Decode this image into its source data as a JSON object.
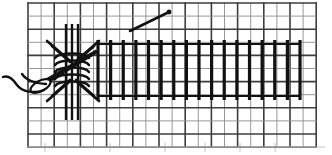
{
  "figure": {
    "background_color": "#ffffff",
    "ink_color": "#1a1a1a",
    "grid_line_color": "#4d4d4d",
    "grid_line_color_light": "#8c8c8c"
  },
  "canvas": {
    "width": 332,
    "height": 155
  },
  "fabric_grid": {
    "label": "even-weave fabric grid",
    "x": 28,
    "y": 3,
    "cell": 13.1,
    "columns": 22,
    "rows": 11,
    "line_width": 1.6,
    "minor_line_width": 0.9,
    "color": "#3d3d3d"
  },
  "stitch_band": {
    "label": "band of vertical satin stitches",
    "x_start": 98,
    "x_end": 300,
    "y_top": 44,
    "y_bottom": 96,
    "stitch_count": 16,
    "stitch_width": 3.2,
    "color": "#111111"
  },
  "wrapped_bar": {
    "label": "wrapped bar with coiled thread",
    "center_x": 72,
    "center_y": 70,
    "coil_count": 5,
    "coil_width": 34,
    "coil_height": 7,
    "bar_top": 24,
    "bar_bottom": 120,
    "color": "#111111"
  },
  "pulled_threads": {
    "label": "fabric threads drawn into an hourglass",
    "top_left": [
      48,
      42
    ],
    "top_right": [
      98,
      42
    ],
    "bottom_left": [
      48,
      100
    ],
    "bottom_right": [
      98,
      100
    ],
    "waist_top_y": 60,
    "waist_bottom_y": 82
  },
  "needle": {
    "label": "threaded tapestry needle",
    "tip": [
      96,
      50
    ],
    "eye_center": [
      38,
      84
    ],
    "length": 68,
    "angle_degrees": -30,
    "color": "#111111"
  },
  "thread_tail": {
    "label": "loose thread tail from needle eye",
    "start": [
      38,
      86
    ],
    "end": [
      3,
      76
    ]
  },
  "working_thread": {
    "label": "diagonal working thread above the band",
    "start": [
      130,
      31
    ],
    "end": [
      169,
      12
    ],
    "line_width": 2.6,
    "color": "#111111"
  },
  "caption": {
    "text": "",
    "visible": false
  },
  "chart_data": {
    "type": "diagram",
    "elements": [
      {
        "name": "fabric-grid",
        "columns": 22,
        "rows": 11,
        "cell_px": 13.1
      },
      {
        "name": "satin-stitch-band",
        "count": 16,
        "span_px": [
          98,
          300
        ]
      },
      {
        "name": "wrapped-bar-coils",
        "count": 5
      },
      {
        "name": "needle",
        "count": 1
      },
      {
        "name": "working-thread",
        "count": 1
      }
    ]
  }
}
